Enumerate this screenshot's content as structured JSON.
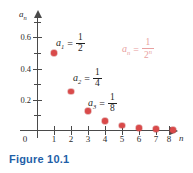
{
  "figure": {
    "caption": "Figure 10.1"
  },
  "chart_data": {
    "type": "scatter",
    "title": "",
    "xlabel": "n",
    "ylabel": "a_n",
    "xlim": [
      0,
      8.8
    ],
    "ylim": [
      0,
      0.72
    ],
    "grid": false,
    "legend_position": "none",
    "x": [
      1,
      2,
      3,
      4,
      5,
      6,
      7,
      8
    ],
    "values": [
      0.5,
      0.25,
      0.125,
      0.0625,
      0.03125,
      0.015625,
      0.0078125,
      0.00390625
    ],
    "series": [
      {
        "name": "a_n = 1/2^n",
        "values": [
          0.5,
          0.25,
          0.125,
          0.0625,
          0.03125,
          0.015625,
          0.0078125,
          0.00390625
        ]
      }
    ],
    "x_ticks": [
      "1",
      "2",
      "3",
      "4",
      "5",
      "6",
      "7",
      "8"
    ],
    "origin_label": "0",
    "y_ticks_major": [
      {
        "value": 0.6,
        "label": "0.6"
      },
      {
        "value": 0.4,
        "label": "0.4"
      },
      {
        "value": 0.2,
        "label": "0.2"
      }
    ],
    "y_ticks_minor": [
      0.7,
      0.5,
      0.3,
      0.1
    ],
    "point_color": "#d94a4a",
    "axis_color": "#4a4a4a",
    "annotations": [
      {
        "variable": "a",
        "index": "1",
        "equals": "=",
        "numerator": "1",
        "denominator": "2"
      },
      {
        "variable": "a",
        "index": "2",
        "equals": "=",
        "numerator": "1",
        "denominator": "4"
      },
      {
        "variable": "a",
        "index": "3",
        "equals": "=",
        "numerator": "1",
        "denominator": "8"
      }
    ],
    "formula": {
      "variable": "a",
      "index": "n",
      "equals": "=",
      "numerator": "1",
      "denominator": "2",
      "exponent": "n",
      "color": "#e8a0a0"
    }
  }
}
